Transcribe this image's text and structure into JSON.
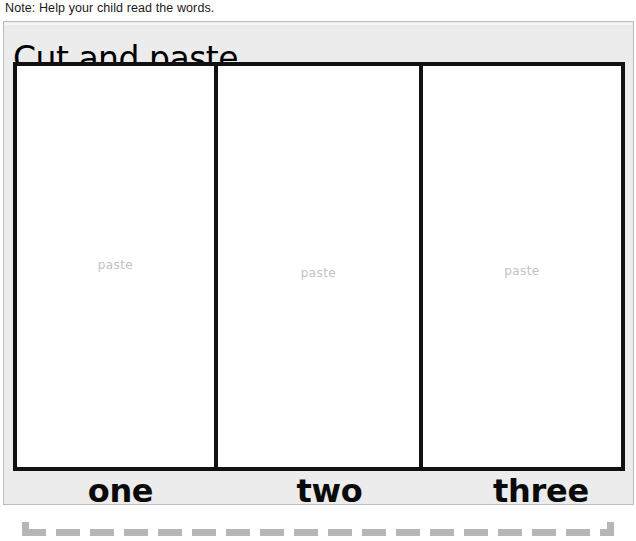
{
  "note": {
    "text": "Note: Help your child read the words."
  },
  "worksheet": {
    "title": "Cut and paste.",
    "boxes": [
      {
        "placeholder": "paste",
        "word": "one"
      },
      {
        "placeholder": "paste",
        "word": "two"
      },
      {
        "placeholder": "paste",
        "word": "three"
      }
    ]
  },
  "cut_line": {
    "icon": "scissors-icon",
    "style": "dashed"
  },
  "colors": {
    "page_background": "#ffffff",
    "panel_background": "#ececec",
    "panel_border": "#bdbdbd",
    "box_border": "#111111",
    "box_fill": "#ffffff",
    "placeholder_text": "#c3c3c3",
    "title_text": "#000000",
    "word_text": "#0a0a0a",
    "note_text": "#1a1a1a",
    "dash_line": "#b6b6b6",
    "scissors": "#111111"
  }
}
